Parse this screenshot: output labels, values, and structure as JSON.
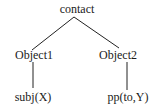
{
  "diagram": {
    "type": "tree",
    "root": {
      "label": "contact",
      "children": [
        {
          "label": "Object1",
          "children": [
            {
              "label": "subj(X)"
            }
          ]
        },
        {
          "label": "Object2",
          "children": [
            {
              "label": "pp(to,Y)"
            }
          ]
        }
      ]
    }
  }
}
